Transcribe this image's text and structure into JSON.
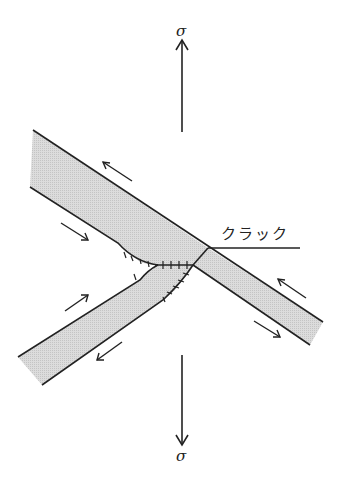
{
  "diagram": {
    "title": "",
    "labels": {
      "sigma_top": "σ",
      "sigma_bottom": "σ",
      "crack": "クラック"
    },
    "colors": {
      "band_fill": "#d4d4d4",
      "line": "#222222",
      "background": "#ffffff"
    },
    "elements": [
      {
        "id": "upper-left-band",
        "type": "shear-band"
      },
      {
        "id": "lower-right-band",
        "type": "shear-band"
      },
      {
        "id": "lower-left-band",
        "type": "shear-band"
      },
      {
        "id": "crack-line",
        "type": "line"
      },
      {
        "id": "stress-arrow-up",
        "type": "arrow"
      },
      {
        "id": "stress-arrow-down",
        "type": "arrow"
      },
      {
        "id": "shear-arrows",
        "type": "arrow-set",
        "count": 6
      }
    ]
  }
}
